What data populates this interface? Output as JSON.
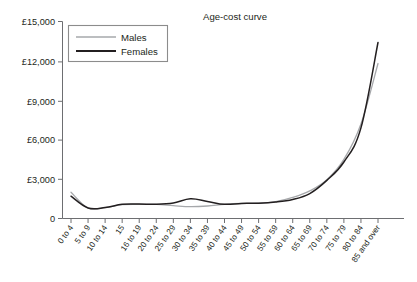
{
  "chart_data": {
    "type": "line",
    "title": "Age-cost curve",
    "xlabel": "",
    "ylabel": "",
    "grid": false,
    "legend_position": "top-left",
    "ylim": [
      0,
      15000
    ],
    "ytick_labels": [
      "0",
      "£3,000",
      "£6,000",
      "£9,000",
      "£12,000",
      "£15,000"
    ],
    "ytick_values": [
      0,
      3000,
      6000,
      9000,
      12000,
      15000
    ],
    "categories": [
      "0 to 4",
      "5 to 9",
      "10 to 14",
      "15",
      "16 to 19",
      "20 to 24",
      "25 to 29",
      "30 to 34",
      "35 to 39",
      "40 to 44",
      "45 to 49",
      "50 to 54",
      "55 to 59",
      "60 to 64",
      "65 to 69",
      "70 to 74",
      "75 to 79",
      "80 to 84",
      "85 and over"
    ],
    "series": [
      {
        "name": "Males",
        "color": "#a6a8ab",
        "values": [
          2000,
          800,
          830,
          1050,
          1080,
          1070,
          980,
          900,
          950,
          1080,
          1150,
          1160,
          1280,
          1600,
          2100,
          2950,
          4500,
          7200,
          11800
        ]
      },
      {
        "name": "Females",
        "color": "#231f20",
        "values": [
          1700,
          800,
          830,
          1080,
          1100,
          1080,
          1180,
          1500,
          1300,
          1080,
          1150,
          1160,
          1250,
          1450,
          1900,
          2900,
          4300,
          6900,
          13400
        ]
      }
    ]
  },
  "legend": {
    "items": [
      {
        "label": "Males"
      },
      {
        "label": "Females"
      }
    ]
  }
}
